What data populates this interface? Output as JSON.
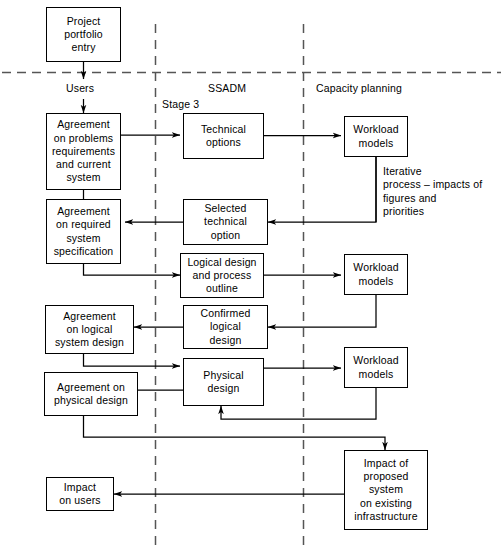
{
  "diagram": {
    "type": "flowchart",
    "background_color": "#ffffff",
    "line_color": "#000000",
    "divider_color": "#555555",
    "lanes": [
      {
        "id": "users",
        "label": "Users"
      },
      {
        "id": "ssadm",
        "label": "SSADM"
      },
      {
        "id": "capacity",
        "label": "Capacity planning"
      }
    ],
    "stage_label": "Stage 3",
    "nodes": [
      {
        "id": "project-portfolio-entry",
        "label": "Project\nportfolio\nentry"
      },
      {
        "id": "agreement-problems",
        "label": "Agreement\non problems\nrequirements\nand current\nsystem"
      },
      {
        "id": "agreement-required-spec",
        "label": "Agreement\non required\nsystem\nspecification"
      },
      {
        "id": "agreement-logical-design",
        "label": "Agreement\non logical\nsystem design"
      },
      {
        "id": "agreement-physical-design",
        "label": "Agreement on\nphysical design"
      },
      {
        "id": "impact-on-users",
        "label": "Impact\non users"
      },
      {
        "id": "technical-options",
        "label": "Technical\noptions"
      },
      {
        "id": "selected-technical-option",
        "label": "Selected\ntechnical\noption"
      },
      {
        "id": "logical-design-process-outline",
        "label": "Logical design\nand process\noutline"
      },
      {
        "id": "confirmed-logical-design",
        "label": "Confirmed\nlogical\ndesign"
      },
      {
        "id": "physical-design",
        "label": "Physical\ndesign"
      },
      {
        "id": "workload-models-1",
        "label": "Workload\nmodels"
      },
      {
        "id": "workload-models-2",
        "label": "Workload\nmodels"
      },
      {
        "id": "workload-models-3",
        "label": "Workload\nmodels"
      },
      {
        "id": "impact-proposed-system",
        "label": "Impact of\nproposed\nsystem\non existing\ninfrastructure"
      }
    ],
    "annotations": [
      {
        "id": "iterative-process-note",
        "text": "Iterative\nprocess – impacts of\nfigures and\npriorities"
      }
    ],
    "caption": ""
  }
}
